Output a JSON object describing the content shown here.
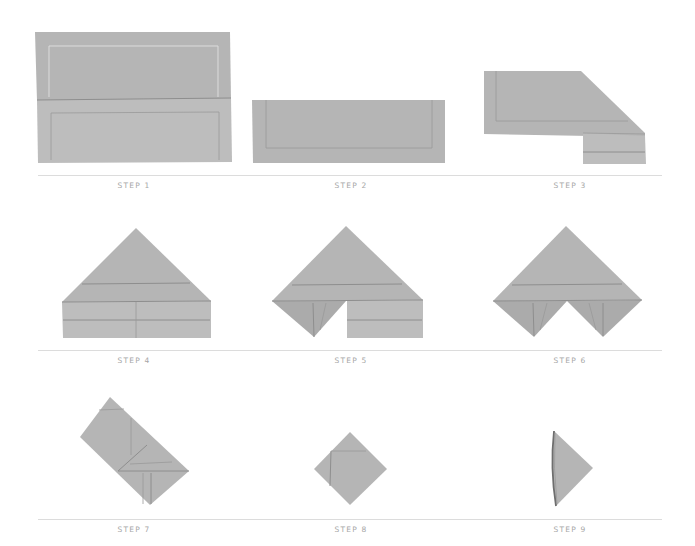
{
  "colors": {
    "fabric": "#b5b5b5",
    "fabric_light": "#bdbdbd",
    "fabric_dark": "#a9a9a9",
    "fold_line": "#8e8e8e",
    "hem_line": "#d6d6d6",
    "separator": "#dcdcdc",
    "label": "#a6a6a6"
  },
  "rows": [
    {
      "steps": [
        {
          "label": "STEP 1"
        },
        {
          "label": "STEP 2"
        },
        {
          "label": "STEP 3"
        }
      ]
    },
    {
      "steps": [
        {
          "label": "STEP 4"
        },
        {
          "label": "STEP 5"
        },
        {
          "label": "STEP 6"
        }
      ]
    },
    {
      "steps": [
        {
          "label": "STEP 7"
        },
        {
          "label": "STEP 8"
        },
        {
          "label": "STEP 9"
        }
      ]
    }
  ]
}
